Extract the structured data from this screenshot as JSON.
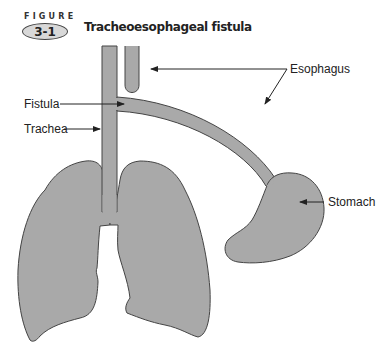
{
  "figure": {
    "word": "FIGURE",
    "number": "3-1",
    "title": "Tracheoesophageal fistula"
  },
  "labels": {
    "esophagus": "Esophagus",
    "fistula": "Fistula",
    "trachea": "Trachea",
    "stomach": "Stomach"
  },
  "colors": {
    "organ_fill": "#a9a9a9",
    "outline": "#444444",
    "text": "#222222"
  }
}
